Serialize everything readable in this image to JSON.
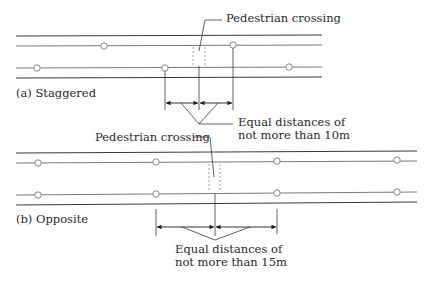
{
  "diagram": {
    "colors": {
      "road_edge": "#3a3a3a",
      "lane_line": "#6a6a6a",
      "stop": "#888888",
      "crossing": "#9a9a9a",
      "text": "#2a2a2a"
    },
    "panel_a": {
      "caption": "(a) Staggered",
      "crossing_label": "Pedestrian crossing",
      "distance_label_line1": "Equal distances of",
      "distance_label_line2": "not more than 10m"
    },
    "panel_b": {
      "caption": "(b) Opposite",
      "crossing_label": "Pedestrian crossing",
      "distance_label_line1": "Equal distances of",
      "distance_label_line2": "not more than 15m"
    }
  }
}
